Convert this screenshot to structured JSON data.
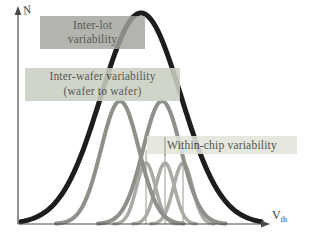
{
  "axes": {
    "y_label": "N",
    "x_label": "V",
    "x_label_sub": "th",
    "color": "#4a4a48"
  },
  "labels": {
    "inter_lot": {
      "line1": "Inter-lot",
      "line2": "variability",
      "bg": "#a2a49d",
      "text_color": "#34342e"
    },
    "inter_wafer": {
      "line1": "Inter-wafer variability",
      "line2": "(wafer to wafer)",
      "bg": "#cad0c2",
      "text_color": "#42423a"
    },
    "within_chip": {
      "line1": "Within-chip variability",
      "bg": "#e1e5da",
      "text_color": "#3a3a33"
    }
  },
  "curves": [
    {
      "name": "within-chip-dist-1",
      "center": 146,
      "sigma": 9.5,
      "amplitude": 61,
      "color": "#a9aaa3",
      "stroke_width": 3.5,
      "range": [
        114,
        178
      ]
    },
    {
      "name": "within-chip-dist-2",
      "center": 165,
      "sigma": 9.5,
      "amplitude": 61,
      "color": "#a9aaa3",
      "stroke_width": 3.5,
      "range": [
        133,
        197
      ]
    },
    {
      "name": "within-chip-dist-3",
      "center": 183,
      "sigma": 9.5,
      "amplitude": 61,
      "color": "#a9aaa3",
      "stroke_width": 3.5,
      "range": [
        151,
        215
      ]
    },
    {
      "name": "inter-wafer-dist-1",
      "center": 120,
      "sigma": 19,
      "amplitude": 123,
      "color": "#8e9089",
      "stroke_width": 4,
      "range": [
        56,
        184
      ]
    },
    {
      "name": "inter-wafer-dist-2",
      "center": 162,
      "sigma": 19,
      "amplitude": 123,
      "color": "#8e9089",
      "stroke_width": 4,
      "range": [
        98,
        226
      ]
    },
    {
      "name": "inter-lot-dist",
      "center": 141,
      "sigma": 40,
      "amplitude": 211,
      "color": "#1d1d1b",
      "stroke_width": 5,
      "range": [
        21,
        261
      ]
    }
  ],
  "mean_lines": [
    {
      "x": 146,
      "y_top": 150
    },
    {
      "x": 165,
      "y_top": 137
    },
    {
      "x": 183,
      "y_top": 150
    }
  ],
  "mean_line_color": "#97978f"
}
